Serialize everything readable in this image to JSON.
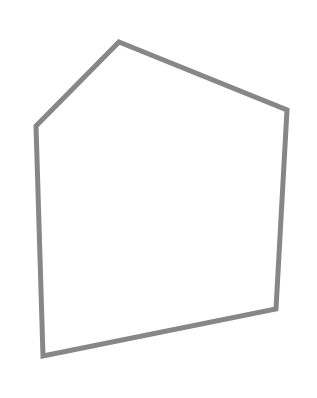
{
  "canvas": {
    "width": 317,
    "height": 398,
    "background": "#ffffff"
  },
  "shape": {
    "type": "pentagon",
    "stroke": "#878787",
    "stroke_width": 5,
    "fill": "none",
    "points": [
      [
        119,
        42
      ],
      [
        287,
        110
      ],
      [
        276,
        309
      ],
      [
        43,
        356
      ],
      [
        36,
        126
      ]
    ]
  }
}
